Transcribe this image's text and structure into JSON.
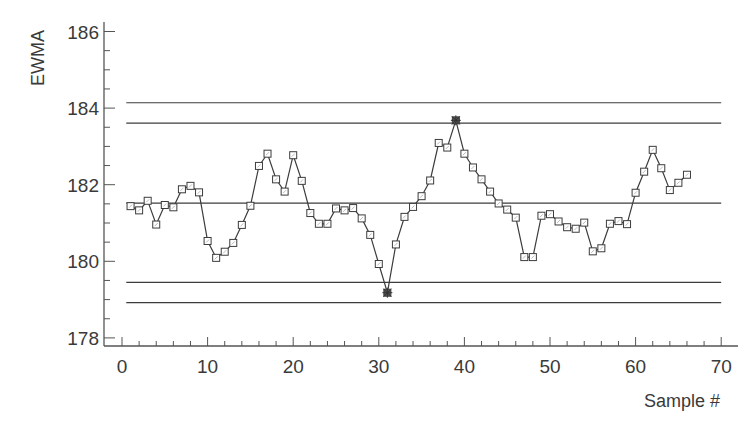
{
  "chart_data": {
    "type": "line",
    "title": "",
    "xlabel": "Sample #",
    "ylabel": "EWMA",
    "xlim": [
      0,
      70
    ],
    "ylim": [
      178,
      186
    ],
    "x_ticks": [
      0,
      10,
      20,
      30,
      40,
      50,
      60,
      70
    ],
    "y_ticks": [
      178,
      180,
      182,
      184,
      186
    ],
    "x_minor_step": 2,
    "y_minor_step": 0.5,
    "grid": false,
    "legend": null,
    "marker": "square",
    "x": [
      1,
      2,
      3,
      4,
      5,
      6,
      7,
      8,
      9,
      10,
      11,
      12,
      13,
      14,
      15,
      16,
      17,
      18,
      19,
      20,
      21,
      22,
      23,
      24,
      25,
      26,
      27,
      28,
      29,
      30,
      31,
      32,
      33,
      34,
      35,
      36,
      37,
      38,
      39,
      40,
      41,
      42,
      43,
      44,
      45,
      46,
      47,
      48,
      49,
      50,
      51,
      52,
      53,
      54,
      55,
      56,
      57,
      58,
      59,
      60,
      61,
      62,
      63,
      64,
      65,
      66
    ],
    "series": [
      {
        "name": "EWMA",
        "values": [
          181.44,
          181.33,
          181.58,
          180.96,
          181.47,
          181.41,
          181.88,
          181.97,
          181.8,
          180.53,
          180.09,
          180.25,
          180.48,
          180.95,
          181.45,
          182.49,
          182.81,
          182.14,
          181.82,
          182.77,
          182.1,
          181.26,
          180.98,
          180.98,
          181.38,
          181.33,
          181.39,
          181.12,
          180.69,
          179.93,
          179.18,
          180.44,
          181.16,
          181.42,
          181.7,
          182.11,
          183.09,
          182.97,
          183.68,
          182.81,
          182.45,
          182.14,
          181.82,
          181.51,
          181.35,
          181.14,
          180.11,
          180.11,
          181.19,
          181.23,
          181.04,
          180.89,
          180.85,
          181.01,
          180.26,
          180.34,
          180.98,
          181.05,
          180.97,
          181.79,
          182.34,
          182.91,
          182.43,
          181.86,
          182.05,
          182.26
        ]
      }
    ],
    "out_of_control_points": [
      31,
      39
    ],
    "reference_lines": [
      {
        "name": "UCL outer",
        "value": 184.14
      },
      {
        "name": "UCL",
        "value": 183.61
      },
      {
        "name": "Center line",
        "value": 181.52
      },
      {
        "name": "LCL",
        "value": 179.45
      },
      {
        "name": "LCL outer",
        "value": 178.92
      }
    ],
    "reference_line_x_range": [
      0.5,
      70
    ]
  },
  "colors": {
    "line": "#3c3c3c",
    "marker_edge": "#3c3c3c",
    "axis": "#555555",
    "text": "#3a3a3a"
  }
}
